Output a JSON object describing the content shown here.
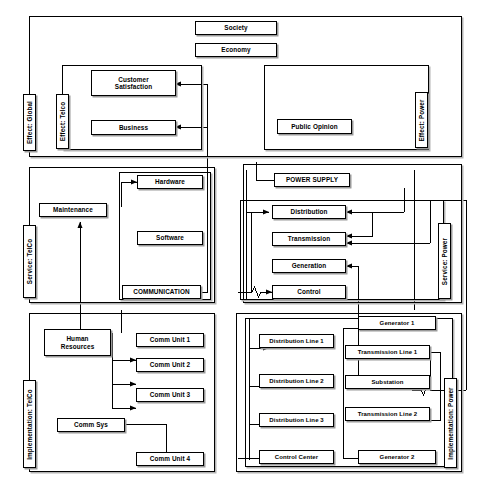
{
  "diagram": {
    "type": "block-diagram",
    "layers": [
      {
        "id": "effect",
        "label_left": "Effect: Global"
      },
      {
        "id": "service",
        "label_left": "Service: TelCo",
        "label_right": "Service: Power"
      },
      {
        "id": "implementation",
        "label_left": "Implementation: TelCo",
        "label_right": "Implementation: Power"
      }
    ],
    "side_labels": {
      "effect_global": "Effect: Global",
      "effect_telco": "Effect: Telco",
      "effect_power": "Effect: Power",
      "service_telco": "Service: TelCo",
      "service_power": "Service: Power",
      "implementation_telco": "Implementation: TelCo",
      "implementation_power": "Implementation: Power"
    },
    "nodes": {
      "society": "Society",
      "economy": "Economy",
      "customer_satisfaction": "Customer\nSatisfaction",
      "customer_satisfaction_line1": "Customer",
      "customer_satisfaction_line2": "Satisfaction",
      "business": "Business",
      "public_opinion": "Public Opinion",
      "maintenance": "Maintenance",
      "hardware": "Hardware",
      "software": "Software",
      "communication": "COMMUNICATION",
      "power_supply": "POWER SUPPLY",
      "distribution": "Distribution",
      "transmission": "Transmission",
      "generation": "Generation",
      "control": "Control",
      "human_resources_line1": "Human",
      "human_resources_line2": "Resources",
      "comm_unit_1": "Comm Unit 1",
      "comm_unit_2": "Comm Unit 2",
      "comm_unit_3": "Comm Unit 3",
      "comm_sys": "Comm Sys",
      "comm_unit_4": "Comm Unit 4",
      "distribution_line_1": "Distribution Line 1",
      "distribution_line_2": "Distribution Line 2",
      "distribution_line_3": "Distribution Line 3",
      "control_center": "Control Center",
      "generator_1": "Generator 1",
      "transmission_line_1": "Transmission Line 1",
      "substation": "Substation",
      "transmission_line_2": "Transmission Line 2",
      "generator_2": "Generator 2"
    },
    "colors": {
      "stroke": "#000000",
      "background": "#ffffff",
      "shadow": "#9a9a9a"
    }
  }
}
